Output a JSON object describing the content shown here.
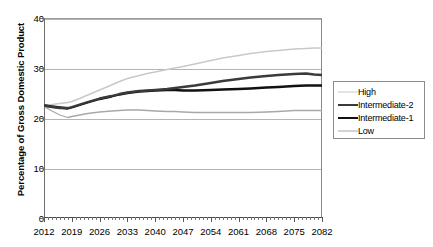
{
  "chart_data": {
    "type": "line",
    "title": "",
    "xlabel": "",
    "ylabel": "Percentage of Gross Domestic Product",
    "xlim": [
      2012,
      2082
    ],
    "ylim": [
      0,
      40
    ],
    "yticks": [
      0,
      10,
      20,
      30,
      40
    ],
    "ytick_labels": [
      "0",
      "10",
      "20",
      "30",
      "40"
    ],
    "grid": true,
    "grid_axis": "y",
    "legend_position": "right",
    "categories": [
      2012,
      2019,
      2026,
      2033,
      2040,
      2047,
      2054,
      2061,
      2068,
      2075,
      2082
    ],
    "xtick_labels": [
      "2012",
      "2019",
      "2026",
      "2033",
      "2040",
      "2047",
      "2054",
      "2061",
      "2068",
      "2075",
      "2082"
    ],
    "x_minor_tick_interval": 1,
    "series": [
      {
        "name": "High",
        "color": "#c9c9c9",
        "width": 1.4,
        "x": [
          2012,
          2014,
          2016,
          2018,
          2019,
          2021,
          2023,
          2026,
          2029,
          2031,
          2033,
          2036,
          2038,
          2040,
          2043,
          2045,
          2047,
          2050,
          2054,
          2057,
          2061,
          2064,
          2068,
          2071,
          2075,
          2078,
          2080,
          2082
        ],
        "values": [
          22.6,
          22.7,
          22.9,
          23.1,
          23.3,
          23.9,
          24.6,
          25.6,
          26.6,
          27.3,
          27.9,
          28.5,
          28.9,
          29.2,
          29.7,
          30.0,
          30.3,
          30.8,
          31.5,
          32.0,
          32.5,
          32.9,
          33.3,
          33.5,
          33.8,
          33.9,
          34.0,
          34.0
        ]
      },
      {
        "name": "Intermediate-2",
        "color": "#3a3a3a",
        "width": 2.3,
        "x": [
          2012,
          2014,
          2016,
          2018,
          2019,
          2021,
          2023,
          2026,
          2029,
          2031,
          2033,
          2036,
          2038,
          2040,
          2043,
          2045,
          2047,
          2050,
          2054,
          2057,
          2061,
          2064,
          2068,
          2071,
          2075,
          2078,
          2080,
          2082
        ],
        "values": [
          22.5,
          22.2,
          22.0,
          22.0,
          22.2,
          22.7,
          23.2,
          23.9,
          24.4,
          24.8,
          25.1,
          25.4,
          25.5,
          25.6,
          25.8,
          26.0,
          26.2,
          26.5,
          27.0,
          27.4,
          27.8,
          28.1,
          28.4,
          28.6,
          28.8,
          28.9,
          28.7,
          28.6
        ]
      },
      {
        "name": "Intermediate-1",
        "color": "#111111",
        "width": 2.3,
        "x": [
          2012,
          2014,
          2016,
          2018,
          2019,
          2021,
          2023,
          2026,
          2029,
          2031,
          2033,
          2036,
          2038,
          2040,
          2043,
          2045,
          2047,
          2050,
          2054,
          2057,
          2061,
          2064,
          2068,
          2071,
          2075,
          2078,
          2080,
          2082
        ],
        "values": [
          22.5,
          22.3,
          22.1,
          21.9,
          22.1,
          22.6,
          23.1,
          23.8,
          24.3,
          24.7,
          25.0,
          25.3,
          25.4,
          25.5,
          25.6,
          25.6,
          25.5,
          25.5,
          25.6,
          25.7,
          25.8,
          25.9,
          26.1,
          26.2,
          26.4,
          26.5,
          26.5,
          26.5
        ]
      },
      {
        "name": "Low",
        "color": "#a8a8a8",
        "width": 1.3,
        "x": [
          2012,
          2014,
          2016,
          2018,
          2019,
          2021,
          2023,
          2026,
          2029,
          2031,
          2033,
          2036,
          2038,
          2040,
          2043,
          2045,
          2047,
          2050,
          2054,
          2057,
          2061,
          2064,
          2068,
          2071,
          2075,
          2078,
          2080,
          2082
        ],
        "values": [
          22.3,
          21.4,
          20.6,
          20.1,
          20.3,
          20.6,
          20.9,
          21.2,
          21.4,
          21.5,
          21.6,
          21.6,
          21.5,
          21.4,
          21.3,
          21.3,
          21.2,
          21.1,
          21.1,
          21.1,
          21.1,
          21.1,
          21.2,
          21.3,
          21.5,
          21.5,
          21.5,
          21.5
        ]
      }
    ]
  },
  "legend": {
    "items": [
      {
        "label": "High"
      },
      {
        "label": "Intermediate-2"
      },
      {
        "label": "Intermediate-1"
      },
      {
        "label": "Low"
      }
    ]
  }
}
